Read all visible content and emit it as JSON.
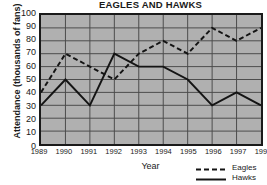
{
  "chart_data": {
    "type": "line",
    "title": "EAGLES AND HAWKS",
    "xlabel": "Year",
    "ylabel": "Attendance (thousands of fans)",
    "categories": [
      "1989",
      "1990",
      "1991",
      "1992",
      "1993",
      "1994",
      "1995",
      "1996",
      "1997",
      "1998"
    ],
    "series": [
      {
        "name": "Eagles",
        "style": "dashed",
        "color": "#141414",
        "values": [
          40,
          70,
          60,
          50,
          70,
          80,
          70,
          90,
          80,
          90
        ]
      },
      {
        "name": "Hawks",
        "style": "solid",
        "color": "#141414",
        "values": [
          30,
          50,
          30,
          70,
          60,
          60,
          50,
          30,
          40,
          30
        ]
      }
    ],
    "ylim": [
      0,
      100
    ],
    "yticks": [
      0,
      10,
      20,
      30,
      40,
      50,
      60,
      70,
      80,
      90,
      100
    ],
    "ytick_labels": [
      "0",
      "10",
      "20",
      "30",
      "40",
      "50",
      "60",
      "70",
      "80",
      "90",
      "100"
    ],
    "grid": true,
    "grid_color": "#4a4a4a",
    "plot_background": "#b0b0b0",
    "legend_position": "bottom-right"
  },
  "legend": {
    "entries": [
      {
        "label": "Eagles",
        "style": "dashed"
      },
      {
        "label": "Hawks",
        "style": "solid"
      }
    ]
  }
}
